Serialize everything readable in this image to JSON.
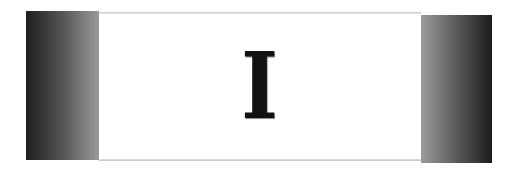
{
  "banner": {
    "letter": "I",
    "colors": {
      "panel_dark": "#1e1e1e",
      "panel_light": "#9a9a9a",
      "center_background": "#ffffff",
      "letter_color": "#111111"
    }
  }
}
